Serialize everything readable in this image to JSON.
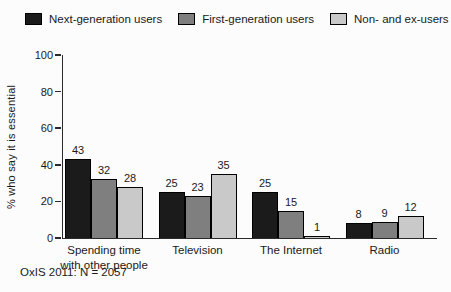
{
  "chart_data": {
    "type": "bar",
    "title": "",
    "xlabel": "",
    "ylabel": "% who say it is essential",
    "ylim": [
      0,
      100
    ],
    "yticks": [
      0,
      20,
      40,
      60,
      80,
      100
    ],
    "grid": false,
    "legend_position": "top",
    "bar_value_labels": true,
    "categories": [
      "Spending time with other people",
      "Television",
      "The Internet",
      "Radio"
    ],
    "category_label_lines": [
      [
        "Spending time",
        "with other people"
      ],
      [
        "Television"
      ],
      [
        "The Internet"
      ],
      [
        "Radio"
      ]
    ],
    "series": [
      {
        "name": "Next-generation users",
        "color": "#1b1b1b",
        "values": [
          43,
          25,
          25,
          8
        ]
      },
      {
        "name": "First-generation users",
        "color": "#7f7f7f",
        "values": [
          32,
          23,
          15,
          9
        ]
      },
      {
        "name": "Non- and ex-users",
        "color": "#c9c9c9",
        "values": [
          28,
          35,
          1,
          12
        ]
      }
    ]
  },
  "footer": {
    "note": "OxIS 2011: N = 2057"
  },
  "colors": {
    "axis": "#2a2a2a",
    "text": "#1a1a1a",
    "background": "#fcfcfc",
    "bar_border": "#000000"
  }
}
